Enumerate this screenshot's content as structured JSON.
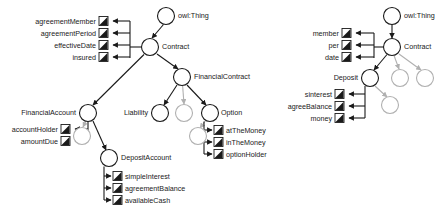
{
  "diagram": {
    "type": "ontology-class-hierarchy",
    "colors": {
      "node_stroke_active": "#1a1a1a",
      "node_stroke_faded": "#b0b0b0",
      "node_fill": "#ffffff",
      "edge_active": "#1a1a1a",
      "edge_faded": "#b0b0b0",
      "property_icon_fill": "#1a1a1a",
      "text": "#1a1a1a",
      "background": "#ffffff"
    },
    "left_panel": {
      "name": "full-ontology-view",
      "classes": [
        {
          "id": "owlThing",
          "label": "owl:Thing",
          "cx": 166,
          "cy": 16,
          "r": 8.5,
          "faded": false,
          "label_side": "right"
        },
        {
          "id": "contract",
          "label": "Contract",
          "cx": 150,
          "cy": 47,
          "r": 8.5,
          "faded": false,
          "label_side": "right"
        },
        {
          "id": "financialContract",
          "label": "FinancialContract",
          "cx": 182,
          "cy": 77,
          "r": 8.5,
          "faded": false,
          "label_side": "right"
        },
        {
          "id": "financialAccount",
          "label": "FinancialAccount",
          "cx": 88,
          "cy": 113,
          "r": 8.5,
          "faded": false,
          "label_side": "left"
        },
        {
          "id": "liability",
          "label": "Liability",
          "cx": 160,
          "cy": 113,
          "r": 8.5,
          "faded": false,
          "label_side": "left"
        },
        {
          "id": "unnamedMid",
          "label": "",
          "cx": 184,
          "cy": 113,
          "r": 8.5,
          "faded": true,
          "label_side": "none"
        },
        {
          "id": "option",
          "label": "Option",
          "cx": 210,
          "cy": 113,
          "r": 8.5,
          "faded": false,
          "label_side": "right"
        },
        {
          "id": "unnamedFaAcct",
          "label": "",
          "cx": 82,
          "cy": 136,
          "r": 8.5,
          "faded": true,
          "label_side": "none"
        },
        {
          "id": "unnamedOpt",
          "label": "",
          "cx": 198,
          "cy": 136,
          "r": 8.5,
          "faded": true,
          "label_side": "none"
        },
        {
          "id": "depositAccount",
          "label": "DepositAccount",
          "cx": 109,
          "cy": 158,
          "r": 8.5,
          "faded": false,
          "label_side": "right"
        }
      ],
      "properties": [
        {
          "id": "agreementMember",
          "label": "agreementMember",
          "x": 92,
          "y": 19,
          "owner": "contract"
        },
        {
          "id": "agreementPeriod",
          "label": "agreementPeriod",
          "x": 92,
          "y": 31,
          "owner": "contract"
        },
        {
          "id": "effectiveDate",
          "label": "effectiveDate",
          "x": 92,
          "y": 43,
          "owner": "contract"
        },
        {
          "id": "insured",
          "label": "insured",
          "x": 92,
          "y": 55,
          "owner": "contract"
        },
        {
          "id": "accountHolder",
          "label": "accountHolder",
          "x": 63,
          "y": 127,
          "owner": "financialAccount"
        },
        {
          "id": "amountDue",
          "label": "amountDue",
          "x": 63,
          "y": 139,
          "owner": "financialAccount"
        },
        {
          "id": "atTheMoney",
          "label": "atTheMoney",
          "x": 215,
          "y": 128,
          "owner": "option"
        },
        {
          "id": "inTheMoney",
          "label": "inTheMoney",
          "x": 215,
          "y": 140,
          "owner": "option"
        },
        {
          "id": "optionHolder",
          "label": "optionHolder",
          "x": 215,
          "y": 152,
          "owner": "option"
        },
        {
          "id": "simpleInterest",
          "label": "simpleInterest",
          "x": 112,
          "y": 174,
          "owner": "depositAccount"
        },
        {
          "id": "agreementBalance",
          "label": "agreementBalance",
          "x": 112,
          "y": 186,
          "owner": "depositAccount"
        },
        {
          "id": "availableCash",
          "label": "availableCash",
          "x": 112,
          "y": 198,
          "owner": "depositAccount"
        }
      ]
    },
    "right_panel": {
      "name": "abbreviated-ontology-view",
      "classes": [
        {
          "id": "r_owlThing",
          "label": "owl:Thing",
          "cx": 392,
          "cy": 16,
          "r": 8.5,
          "faded": false,
          "label_side": "right"
        },
        {
          "id": "r_contract",
          "label": "Contract",
          "cx": 392,
          "cy": 47,
          "r": 8.5,
          "faded": false,
          "label_side": "right"
        },
        {
          "id": "r_deposit",
          "label": "Deposit",
          "cx": 370,
          "cy": 78,
          "r": 8.5,
          "faded": false,
          "label_side": "left"
        },
        {
          "id": "r_fade1",
          "label": "",
          "cx": 400,
          "cy": 78,
          "r": 8.5,
          "faded": true,
          "label_side": "none"
        },
        {
          "id": "r_fade2",
          "label": "",
          "cx": 425,
          "cy": 78,
          "r": 8.5,
          "faded": true,
          "label_side": "none"
        },
        {
          "id": "r_fade3",
          "label": "",
          "cx": 390,
          "cy": 105,
          "r": 8.5,
          "faded": true,
          "label_side": "none"
        }
      ],
      "properties": [
        {
          "id": "member",
          "label": "member",
          "x": 330,
          "y": 31,
          "owner": "r_contract"
        },
        {
          "id": "per",
          "label": "per",
          "x": 330,
          "y": 43,
          "owner": "r_contract"
        },
        {
          "id": "date",
          "label": "date",
          "x": 330,
          "y": 55,
          "owner": "r_contract"
        },
        {
          "id": "sinterest",
          "label": "sinterest",
          "x": 310,
          "y": 92,
          "owner": "r_deposit"
        },
        {
          "id": "agreeBalance",
          "label": "agreeBalance",
          "x": 310,
          "y": 104,
          "owner": "r_deposit"
        },
        {
          "id": "money",
          "label": "money",
          "x": 310,
          "y": 116,
          "owner": "r_deposit"
        }
      ]
    }
  }
}
